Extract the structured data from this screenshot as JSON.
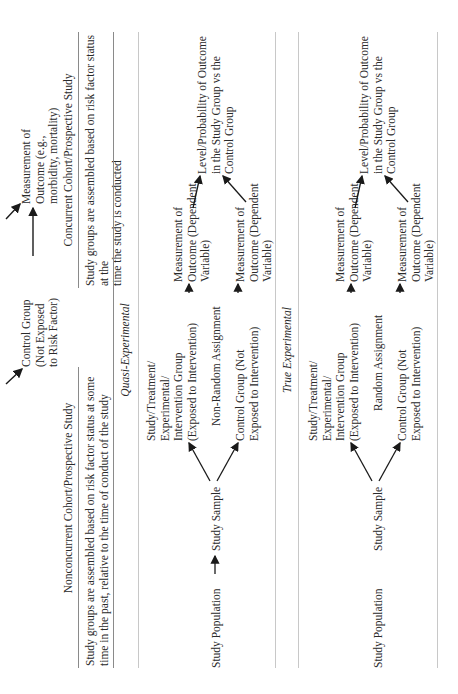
{
  "top_diagram": {
    "control_group": [
      "Control Group",
      "(Not Exposed",
      "to Risk Factor)"
    ],
    "measurement": [
      "Measurement of",
      "Outcome (e.g.,",
      "morbidity, mortality)"
    ]
  },
  "headers": {
    "nonconcurrent": "Nonconcurrent Cohort/Prospective Study",
    "concurrent": "Concurrent Cohort/Prospective Study"
  },
  "descriptions": {
    "nonconcurrent": [
      "Study groups are assembled based on risk factor status at some",
      "time in the past, relative to the time of conduct of the study"
    ],
    "concurrent": [
      "Study groups are assembled based on risk factor status at the",
      "time the study is conducted"
    ]
  },
  "sections": [
    {
      "title": "Quasi-Experimental",
      "population": "Study Population",
      "sample": "Study Sample",
      "has_population_arrow": true,
      "study_group": [
        "Study/Treatment/",
        "Experimental/",
        "Intervention Group",
        "(Exposed to Intervention)"
      ],
      "assignment": "Non-Random Assignment",
      "control_group": [
        "Control Group (Not",
        "Exposed to Intervention)"
      ],
      "measurement_study": [
        "Measurement of",
        "Outcome (Dependent",
        "Variable)"
      ],
      "measurement_control": [
        "Measurement of",
        "Outcome (Dependent",
        "Variable)"
      ],
      "result": [
        "Level/Probability of Outcome",
        "in the Study Group vs the",
        "Control Group"
      ]
    },
    {
      "title": "True Experimental",
      "population": "Study Population",
      "sample": "Study Sample",
      "has_population_arrow": false,
      "study_group": [
        "Study/Treatment/",
        "Experimental/",
        "Intervention Group",
        "(Exposed to Intervention)"
      ],
      "assignment": "Random Assignment",
      "control_group": [
        "Control Group (Not",
        "Exposed to Intervention)"
      ],
      "measurement_study": [
        "Measurement of",
        "Outcome (Dependent",
        "Variable)"
      ],
      "measurement_control": [
        "Measurement of",
        "Outcome (Dependent",
        "Variable)"
      ],
      "result": [
        "Level/Probability of Outcome",
        "in the Study Group vs the",
        "Control Group"
      ]
    }
  ]
}
